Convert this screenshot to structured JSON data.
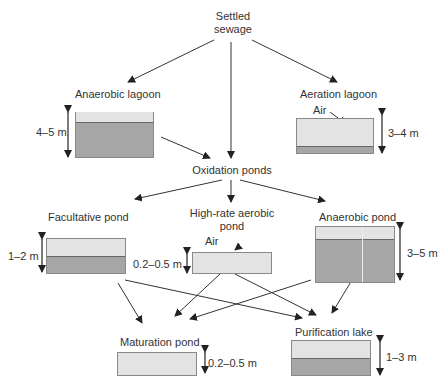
{
  "title_node": {
    "line1": "Settled",
    "line2": "sewage"
  },
  "hub": {
    "label": "Oxidation ponds"
  },
  "nodes": {
    "anaerobic_lagoon": {
      "label": "Anaerobic lagoon",
      "depth": "4–5 m"
    },
    "aeration_lagoon": {
      "label": "Aeration lagoon",
      "depth": "3–4 m",
      "air": "Air"
    },
    "facultative_pond": {
      "label": "Facultative pond",
      "depth": "1–2 m"
    },
    "high_rate_aerobic_pond": {
      "label_line1": "High-rate aerobic",
      "label_line2": "pond",
      "depth": "0.2–0.5 m",
      "air": "Air"
    },
    "anaerobic_pond": {
      "label": "Anaerobic pond",
      "depth": "3–5 m"
    },
    "maturation_pond": {
      "label": "Maturation pond",
      "depth": "0.2–0.5 m"
    },
    "purification_lake": {
      "label": "Purification lake",
      "depth": "1–3 m"
    }
  },
  "colors": {
    "water": "#e3e3e3",
    "sludge": "#a6a6a6",
    "line": "#333333"
  }
}
